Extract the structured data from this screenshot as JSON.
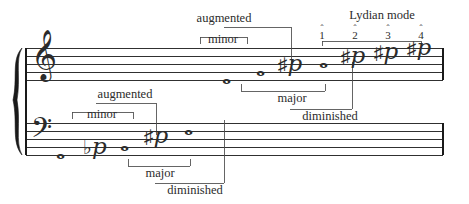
{
  "figure": {
    "type": "music-notation",
    "width": 469,
    "height": 204,
    "ink_color": "#1a1a1a",
    "text_color": "#2b2b2b",
    "paper_color": "#ffffff"
  },
  "systems": {
    "brace": "grand-staff-brace",
    "treble": {
      "clef": "treble-clef",
      "clef_glyph": "𝄞",
      "staff_top_y": 48,
      "line_gap": 8,
      "notes": [
        {
          "id": "t1",
          "name": "note-whole-1",
          "x": 228,
          "y": 80,
          "accidental": "",
          "glyph": "𝅝"
        },
        {
          "id": "t2",
          "name": "note-whole-2",
          "x": 262,
          "y": 72,
          "accidental": "",
          "glyph": "𝅝"
        },
        {
          "id": "t3",
          "name": "note-sharp-3",
          "x": 290,
          "y": 68,
          "accidental": "sharp",
          "glyph": "♯"
        },
        {
          "id": "t4",
          "name": "note-whole-4",
          "x": 325,
          "y": 64,
          "accidental": "",
          "glyph": "𝅝"
        },
        {
          "id": "t5",
          "name": "note-sharp-5",
          "x": 352,
          "y": 60,
          "accidental": "sharp",
          "glyph": "♯"
        },
        {
          "id": "t6",
          "name": "note-sharp-6",
          "x": 385,
          "y": 56,
          "accidental": "sharp",
          "glyph": "♯"
        },
        {
          "id": "t7",
          "name": "note-sharp-7",
          "x": 418,
          "y": 52,
          "accidental": "sharp",
          "glyph": "♯"
        }
      ]
    },
    "bass": {
      "clef": "bass-clef",
      "clef_glyph": "𝄢",
      "staff_top_y": 123,
      "line_gap": 8,
      "notes": [
        {
          "id": "b1",
          "name": "note-whole-1",
          "x": 62,
          "y": 155,
          "accidental": "",
          "glyph": "𝅝"
        },
        {
          "id": "b2",
          "name": "note-flat-2",
          "x": 94,
          "y": 151,
          "accidental": "flat",
          "glyph": "♭"
        },
        {
          "id": "b3",
          "name": "note-whole-3",
          "x": 126,
          "y": 147,
          "accidental": "",
          "glyph": "𝅝"
        },
        {
          "id": "b4",
          "name": "note-sharp-4",
          "x": 155,
          "y": 139,
          "accidental": "sharp",
          "glyph": "♯"
        },
        {
          "id": "b5",
          "name": "note-whole-5",
          "x": 190,
          "y": 131,
          "accidental": "",
          "glyph": "𝅝"
        }
      ]
    }
  },
  "labels": {
    "treble": {
      "augmented": "augmented",
      "minor": "minor",
      "major": "major",
      "diminished": "diminished",
      "lydian_mode": "Lydian mode"
    },
    "bass": {
      "augmented": "augmented",
      "minor": "minor",
      "major": "major",
      "diminished": "diminished"
    }
  },
  "scale_degrees": [
    {
      "caret": "ˆ",
      "number": "1",
      "x": 322
    },
    {
      "caret": "ˆ",
      "number": "2",
      "x": 355
    },
    {
      "caret": "ˆ",
      "number": "3",
      "x": 388
    },
    {
      "caret": "ˆ",
      "number": "4",
      "x": 421
    }
  ]
}
